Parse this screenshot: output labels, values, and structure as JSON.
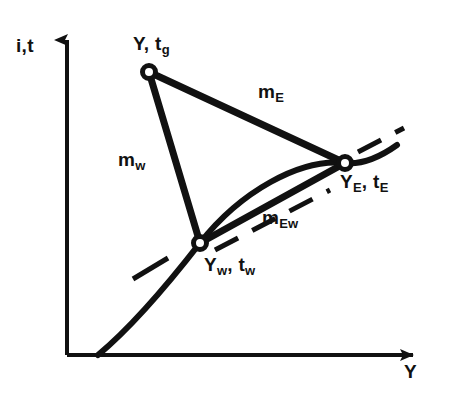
{
  "figure": {
    "background_color": "#ffffff",
    "ink_color": "#111111"
  },
  "axes": {
    "y_label_base": "i,t",
    "y_label_sub": "",
    "x_label_base": "Y",
    "x_label_sub": "",
    "origin": [
      67,
      355
    ],
    "y_top": [
      67,
      30
    ],
    "x_right": [
      425,
      355
    ]
  },
  "nodes": [
    {
      "id": "gas",
      "label_base": "Y, t",
      "label_sub": "g",
      "x": 149,
      "y": 72
    },
    {
      "id": "equilibrium",
      "label_base": "Y",
      "label_sub": "E",
      "label_base2": ", t",
      "label_sub2": "E",
      "x": 345,
      "y": 163
    },
    {
      "id": "wetbulb",
      "label_base": "Y",
      "label_sub": "w",
      "label_base2": ", t",
      "label_sub2": "w",
      "x": 200,
      "y": 243
    }
  ],
  "edges": [
    {
      "id": "m-E",
      "label_base": "m",
      "label_sub": "E",
      "from": "gas",
      "to": "equilibrium"
    },
    {
      "id": "m-w",
      "label_base": "m",
      "label_sub": "w",
      "from": "gas",
      "to": "wetbulb"
    },
    {
      "id": "m-Ew",
      "label_base": "m",
      "label_sub": "Ew",
      "from": "wetbulb",
      "to": "equilibrium"
    }
  ],
  "curve": {
    "id": "saturation-curve",
    "start": [
      98,
      355
    ],
    "end": [
      397,
      145
    ],
    "description": "saturation humidity curve"
  },
  "dashed": {
    "id": "chord-tangent",
    "description": "dashed chord parallel to wet-bulb to equilibrium segment, extended beyond both nodes"
  }
}
